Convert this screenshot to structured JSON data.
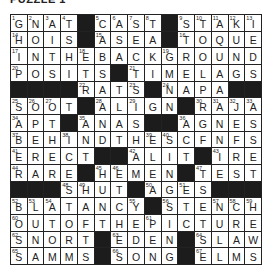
{
  "title": "PUZZLE 1",
  "grid": {
    "rows": 16,
    "cols": 15,
    "cells": [
      [
        "G",
        "N",
        "A",
        "T",
        "#",
        "C",
        "A",
        "S",
        "T",
        "#",
        "S",
        "T",
        "A",
        "K",
        "I"
      ],
      [
        "H",
        "O",
        "I",
        "S",
        "#",
        "A",
        "S",
        "E",
        "A",
        "#",
        "T",
        "O",
        "Q",
        "U",
        "E"
      ],
      [
        "I",
        "N",
        "T",
        "H",
        "E",
        "B",
        "A",
        "C",
        "K",
        "G",
        "R",
        "O",
        "U",
        "N",
        "D"
      ],
      [
        "P",
        "O",
        "S",
        "I",
        "T",
        "S",
        "#",
        "T",
        "I",
        "M",
        "E",
        "L",
        "A",
        "G",
        "S"
      ],
      [
        "#",
        "#",
        "#",
        "#",
        "R",
        "A",
        "T",
        "S",
        "#",
        "N",
        "A",
        "P",
        "A",
        "#",
        "#"
      ],
      [
        "S",
        "O",
        "O",
        "T",
        "#",
        "A",
        "L",
        "I",
        "G",
        "N",
        "#",
        "R",
        "A",
        "J",
        "A"
      ],
      [
        "A",
        "P",
        "T",
        "#",
        "A",
        "N",
        "A",
        "S",
        "#",
        "#",
        "A",
        "G",
        "N",
        "E",
        "S"
      ],
      [
        "B",
        "E",
        "H",
        "I",
        "N",
        "D",
        "T",
        "H",
        "E",
        "S",
        "C",
        "F",
        "N",
        "F",
        "S"
      ],
      [
        "E",
        "R",
        "E",
        "C",
        "T",
        "#",
        "#",
        "A",
        "L",
        "I",
        "T",
        "#",
        "I",
        "R",
        "E"
      ],
      [
        "R",
        "A",
        "R",
        "E",
        "#",
        "H",
        "E",
        "M",
        "E",
        "N",
        "#",
        "T",
        "E",
        "S",
        "T"
      ],
      [
        "#",
        "#",
        "#",
        "S",
        "H",
        "U",
        "T",
        "#",
        "A",
        "G",
        "E",
        "S",
        "#",
        "#",
        "#"
      ],
      [
        "B",
        "L",
        "A",
        "T",
        "A",
        "N",
        "C",
        "Y",
        "#",
        "S",
        "T",
        "E",
        "N",
        "C",
        "H"
      ],
      [
        "O",
        "U",
        "T",
        "O",
        "F",
        "T",
        "H",
        "E",
        "P",
        "I",
        "C",
        "T",
        "U",
        "R",
        "E"
      ],
      [
        "S",
        "N",
        "O",
        "R",
        "T",
        "#",
        "E",
        "D",
        "E",
        "N",
        "#",
        "S",
        "L",
        "A",
        "W"
      ],
      [
        "S",
        "A",
        "M",
        "M",
        "S",
        "#",
        "S",
        "O",
        "N",
        "G",
        "#",
        "E",
        "L",
        "M",
        "S"
      ]
    ],
    "numbers": [
      [
        1,
        2,
        3,
        4,
        0,
        5,
        6,
        7,
        8,
        0,
        9,
        10,
        11,
        12,
        13
      ],
      [
        14,
        0,
        0,
        0,
        0,
        15,
        0,
        0,
        0,
        0,
        16,
        0,
        0,
        0,
        0
      ],
      [
        17,
        0,
        0,
        0,
        18,
        0,
        0,
        0,
        0,
        19,
        0,
        0,
        0,
        0,
        0
      ],
      [
        20,
        0,
        0,
        0,
        0,
        0,
        0,
        21,
        0,
        0,
        0,
        0,
        0,
        0,
        0
      ],
      [
        0,
        0,
        0,
        0,
        22,
        0,
        0,
        23,
        0,
        24,
        0,
        0,
        0,
        0,
        0
      ],
      [
        25,
        26,
        27,
        0,
        0,
        28,
        0,
        29,
        0,
        0,
        0,
        30,
        31,
        32,
        33
      ],
      [
        34,
        0,
        0,
        0,
        35,
        0,
        0,
        0,
        0,
        0,
        36,
        0,
        0,
        0,
        0
      ],
      [
        37,
        0,
        0,
        38,
        0,
        0,
        0,
        0,
        39,
        40,
        0,
        0,
        0,
        0,
        0
      ],
      [
        41,
        0,
        0,
        0,
        0,
        0,
        0,
        42,
        0,
        0,
        0,
        0,
        43,
        0,
        0
      ],
      [
        44,
        0,
        0,
        0,
        0,
        45,
        46,
        0,
        0,
        0,
        0,
        47,
        0,
        0,
        0
      ],
      [
        0,
        0,
        0,
        48,
        49,
        0,
        0,
        0,
        50,
        0,
        51,
        0,
        0,
        0,
        0
      ],
      [
        52,
        53,
        54,
        0,
        0,
        0,
        0,
        55,
        0,
        56,
        0,
        0,
        57,
        58,
        59
      ],
      [
        60,
        0,
        0,
        0,
        0,
        0,
        0,
        0,
        61,
        0,
        0,
        0,
        0,
        0,
        0
      ],
      [
        62,
        0,
        0,
        0,
        0,
        0,
        63,
        0,
        0,
        0,
        0,
        64,
        0,
        0,
        0
      ],
      [
        65,
        0,
        0,
        0,
        0,
        0,
        66,
        0,
        0,
        0,
        0,
        67,
        0,
        0,
        0
      ]
    ]
  },
  "colors": {
    "black_square": "#1c1c1c",
    "grid_line": "#222222",
    "background": "#ffffff"
  }
}
